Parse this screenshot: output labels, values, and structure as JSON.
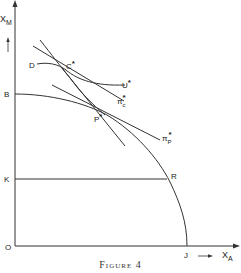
{
  "figure": {
    "caption": "Figure 4",
    "axes": {
      "y_label": "X",
      "y_label_sub": "M",
      "x_label": "X",
      "x_label_sub": "A",
      "origin_label": "O"
    },
    "points": {
      "B": "B",
      "K": "K",
      "R": "R",
      "J": "J",
      "D": "D",
      "C_star": "C",
      "P_star": "P",
      "star": "*"
    },
    "curves": {
      "U_star": "U",
      "pi_c": "π",
      "pi_c_sub": "c",
      "pi_p": "π",
      "pi_p_sub": "P"
    },
    "colors": {
      "line": "#333333",
      "text": "#222222",
      "background": "#ffffff"
    }
  }
}
